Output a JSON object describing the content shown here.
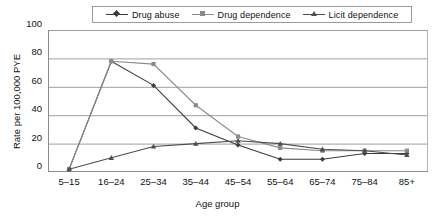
{
  "chart_data": {
    "type": "line",
    "title": "",
    "xlabel": "Age group",
    "ylabel": "Rate per 100,000 PYE",
    "categories": [
      "5–15",
      "16–24",
      "25–34",
      "35–44",
      "45–54",
      "55–64",
      "65–74",
      "75–84",
      "85+"
    ],
    "ylim": [
      0,
      100
    ],
    "yticks": [
      0,
      20,
      40,
      60,
      80,
      100
    ],
    "ytick_labels": [
      "0",
      "20",
      "40",
      "60",
      "80",
      "100"
    ],
    "grid": "horizontal",
    "legend_position": "top-center",
    "series": [
      {
        "name": "Drug abuse",
        "marker": "diamond",
        "color": "#3b3b3b",
        "values": [
          2,
          78,
          61,
          31,
          19,
          9,
          9,
          13,
          13
        ]
      },
      {
        "name": "Drug dependence",
        "marker": "square",
        "color": "#8a8a8a",
        "values": [
          2,
          78,
          76,
          47,
          25,
          17,
          15,
          15,
          15
        ]
      },
      {
        "name": "Licit dependence",
        "marker": "triangle",
        "color": "#4d4d4d",
        "values": [
          2,
          10,
          18,
          20,
          22,
          20,
          16,
          15,
          12
        ]
      }
    ]
  },
  "axes": {
    "ylabel": "Rate per 100,000 PYE",
    "xlabel": "Age group"
  },
  "legend": {
    "items": [
      {
        "label": "Drug abuse"
      },
      {
        "label": "Drug dependence"
      },
      {
        "label": "Licit dependence"
      }
    ]
  },
  "colors": {
    "series_drug_abuse": "#3b3b3b",
    "series_drug_dependence": "#8a8a8a",
    "series_licit_dependence": "#4d4d4d",
    "gridline": "#9e9e9e",
    "axis": "#8c8c8c",
    "plot_border": "#b5b5b5",
    "text": "#111111",
    "background": "#ffffff"
  }
}
